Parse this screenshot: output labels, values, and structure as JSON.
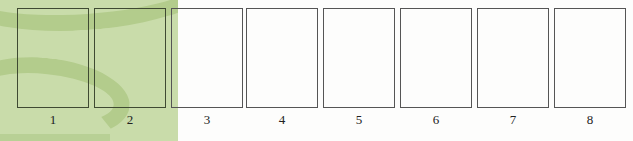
{
  "figure": {
    "type": "numbered-empty-frames",
    "background": {
      "left_panel_color": "#c9dcaa",
      "swoosh_color": "#b3cc8c",
      "page_color": "#fdfdfc"
    },
    "frames": [
      {
        "label": "1",
        "x": 17
      },
      {
        "label": "2",
        "x": 94
      },
      {
        "label": "3",
        "x": 171
      },
      {
        "label": "4",
        "x": 246
      },
      {
        "label": "5",
        "x": 323
      },
      {
        "label": "6",
        "x": 400
      },
      {
        "label": "7",
        "x": 477
      },
      {
        "label": "8",
        "x": 554
      }
    ]
  }
}
